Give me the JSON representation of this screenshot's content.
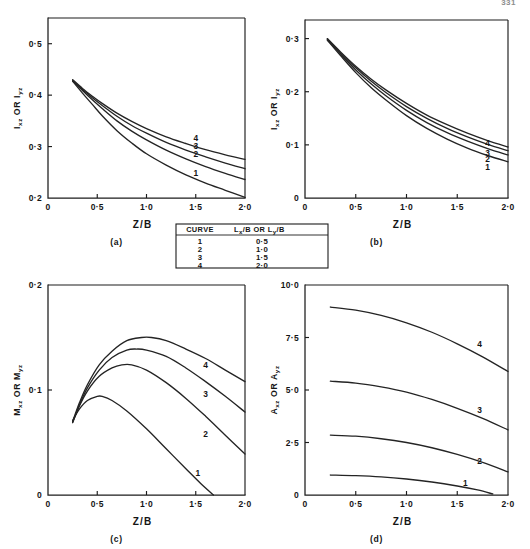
{
  "page": {
    "number": "331",
    "background_color": "#ffffff",
    "ink_color": "#1c1c1c"
  },
  "legend_table": {
    "name": "curve-legend",
    "headers": [
      "CURVE",
      "Lx/B  OR  Ly/B"
    ],
    "header_main": "CURVE",
    "header_value": "L",
    "header_value_sub1": "x",
    "header_value_mid": "/B  OR  L",
    "header_value_sub2": "y",
    "header_value_end": "/B",
    "rows": [
      {
        "curve": "1",
        "ratio": "0·5"
      },
      {
        "curve": "2",
        "ratio": "1·0"
      },
      {
        "curve": "3",
        "ratio": "1·5"
      },
      {
        "curve": "4",
        "ratio": "2·0"
      }
    ]
  },
  "chart_data": [
    {
      "id": "panel-a",
      "type": "line",
      "caption": "(a)",
      "title": "",
      "ylabel": "Ixz OR Iyz",
      "ylabel_parts": {
        "sym1": "I",
        "sub1": "xz",
        "mid": " OR ",
        "sym2": "I",
        "sub2": "yz"
      },
      "xlabel": "Z/B",
      "xlim": [
        0,
        2.0
      ],
      "ylim": [
        0.2,
        0.55
      ],
      "xticks": [
        0,
        0.5,
        1.0,
        1.5,
        2.0
      ],
      "xticklabels": [
        "0",
        "0·5",
        "1·0",
        "1·5",
        "2·0"
      ],
      "yticks": [
        0.2,
        0.3,
        0.4,
        0.5
      ],
      "yticklabels": [
        "0·2",
        "0·3",
        "0·4",
        "0·5"
      ],
      "grid": false,
      "legend_position": "inline-right",
      "series": [
        {
          "name": "1",
          "label_xy": [
            1.5,
            0.243
          ],
          "x": [
            0.25,
            0.35,
            0.45,
            0.55,
            0.7,
            0.85,
            1.0,
            1.2,
            1.4,
            1.6,
            1.8,
            2.0
          ],
          "values": [
            0.427,
            0.404,
            0.382,
            0.36,
            0.331,
            0.307,
            0.286,
            0.264,
            0.245,
            0.229,
            0.215,
            0.201
          ]
        },
        {
          "name": "2",
          "label_xy": [
            1.5,
            0.279
          ],
          "x": [
            0.25,
            0.35,
            0.45,
            0.55,
            0.7,
            0.85,
            1.0,
            1.2,
            1.4,
            1.6,
            1.8,
            2.0
          ],
          "values": [
            0.428,
            0.409,
            0.391,
            0.374,
            0.35,
            0.33,
            0.313,
            0.293,
            0.276,
            0.261,
            0.248,
            0.236
          ]
        },
        {
          "name": "3",
          "label_xy": [
            1.5,
            0.295
          ],
          "x": [
            0.25,
            0.35,
            0.45,
            0.55,
            0.7,
            0.85,
            1.0,
            1.2,
            1.4,
            1.6,
            1.8,
            2.0
          ],
          "values": [
            0.429,
            0.411,
            0.395,
            0.38,
            0.359,
            0.341,
            0.326,
            0.308,
            0.293,
            0.28,
            0.268,
            0.257
          ]
        },
        {
          "name": "4",
          "label_xy": [
            1.5,
            0.311
          ],
          "x": [
            0.25,
            0.35,
            0.45,
            0.55,
            0.7,
            0.85,
            1.0,
            1.2,
            1.4,
            1.6,
            1.8,
            2.0
          ],
          "values": [
            0.43,
            0.413,
            0.398,
            0.384,
            0.365,
            0.349,
            0.335,
            0.319,
            0.306,
            0.294,
            0.284,
            0.275
          ]
        }
      ]
    },
    {
      "id": "panel-b",
      "type": "line",
      "caption": "(b)",
      "title": "",
      "ylabel": "Ixz OR Iyz",
      "ylabel_parts": {
        "sym1": "I",
        "sub1": "xz",
        "mid": " OR ",
        "sym2": "I",
        "sub2": "yz"
      },
      "xlabel": "Z/B",
      "xlim": [
        0,
        2.0
      ],
      "ylim": [
        0,
        0.335
      ],
      "xticks": [
        0,
        0.5,
        1.0,
        1.5,
        2.0
      ],
      "xticklabels": [
        "0",
        "0·5",
        "1·0",
        "1·5",
        "2·0"
      ],
      "yticks": [
        0,
        0.1,
        0.2,
        0.3
      ],
      "yticklabels": [
        "0",
        "0·1",
        "0·2",
        "0·3"
      ],
      "grid": false,
      "legend_position": "inline-right",
      "series": [
        {
          "name": "1",
          "label_xy": [
            1.8,
            0.052
          ],
          "x": [
            0.22,
            0.35,
            0.5,
            0.65,
            0.8,
            1.0,
            1.2,
            1.4,
            1.6,
            1.8,
            2.0
          ],
          "values": [
            0.297,
            0.268,
            0.236,
            0.208,
            0.184,
            0.155,
            0.131,
            0.111,
            0.094,
            0.08,
            0.068
          ]
        },
        {
          "name": "2",
          "label_xy": [
            1.8,
            0.068
          ],
          "x": [
            0.22,
            0.35,
            0.5,
            0.65,
            0.8,
            1.0,
            1.2,
            1.4,
            1.6,
            1.8,
            2.0
          ],
          "values": [
            0.298,
            0.271,
            0.241,
            0.215,
            0.192,
            0.165,
            0.142,
            0.123,
            0.107,
            0.093,
            0.081
          ]
        },
        {
          "name": "3",
          "label_xy": [
            1.8,
            0.079
          ],
          "x": [
            0.22,
            0.35,
            0.5,
            0.65,
            0.8,
            1.0,
            1.2,
            1.4,
            1.6,
            1.8,
            2.0
          ],
          "values": [
            0.299,
            0.273,
            0.245,
            0.22,
            0.198,
            0.172,
            0.15,
            0.131,
            0.115,
            0.101,
            0.089
          ]
        },
        {
          "name": "4",
          "label_xy": [
            1.8,
            0.097
          ],
          "x": [
            0.22,
            0.35,
            0.5,
            0.65,
            0.8,
            1.0,
            1.2,
            1.4,
            1.6,
            1.8,
            2.0
          ],
          "values": [
            0.3,
            0.275,
            0.248,
            0.224,
            0.203,
            0.178,
            0.156,
            0.138,
            0.122,
            0.108,
            0.096
          ]
        }
      ]
    },
    {
      "id": "panel-c",
      "type": "line",
      "caption": "(c)",
      "title": "",
      "ylabel": "Mxz OR Myz",
      "ylabel_parts": {
        "sym1": "M",
        "sub1": "xz",
        "mid": " OR ",
        "sym2": "M",
        "sub2": "yz"
      },
      "xlabel": "Z/B",
      "xlim": [
        0,
        2.0
      ],
      "ylim": [
        0,
        0.2
      ],
      "xticks": [
        0,
        0.5,
        1.0,
        1.5,
        2.0
      ],
      "xticklabels": [
        "0",
        "0·5",
        "1·0",
        "1·5",
        "2·0"
      ],
      "yticks": [
        0,
        0.1,
        0.2
      ],
      "yticklabels": [
        "0",
        "0·1",
        "0·2"
      ],
      "grid": false,
      "legend_position": "inline-right",
      "series": [
        {
          "name": "1",
          "label_xy": [
            1.52,
            0.018
          ],
          "x": [
            0.25,
            0.32,
            0.4,
            0.5,
            0.55,
            0.65,
            0.8,
            1.0,
            1.2,
            1.4,
            1.55,
            1.68
          ],
          "values": [
            0.071,
            0.082,
            0.09,
            0.094,
            0.094,
            0.09,
            0.08,
            0.063,
            0.044,
            0.025,
            0.011,
            0.0
          ]
        },
        {
          "name": "2",
          "label_xy": [
            1.6,
            0.055
          ],
          "x": [
            0.25,
            0.32,
            0.4,
            0.52,
            0.65,
            0.75,
            0.85,
            1.0,
            1.2,
            1.4,
            1.6,
            1.8,
            2.0
          ],
          "values": [
            0.069,
            0.085,
            0.099,
            0.113,
            0.121,
            0.124,
            0.124,
            0.119,
            0.107,
            0.092,
            0.075,
            0.057,
            0.039
          ]
        },
        {
          "name": "3",
          "label_xy": [
            1.6,
            0.093
          ],
          "x": [
            0.25,
            0.32,
            0.4,
            0.52,
            0.65,
            0.8,
            0.9,
            1.0,
            1.2,
            1.4,
            1.6,
            1.8,
            2.0
          ],
          "values": [
            0.069,
            0.086,
            0.102,
            0.119,
            0.131,
            0.138,
            0.139,
            0.138,
            0.132,
            0.121,
            0.108,
            0.094,
            0.079
          ]
        },
        {
          "name": "4",
          "label_xy": [
            1.6,
            0.121
          ],
          "x": [
            0.25,
            0.32,
            0.4,
            0.52,
            0.65,
            0.8,
            0.95,
            1.05,
            1.2,
            1.4,
            1.6,
            1.8,
            2.0
          ],
          "values": [
            0.07,
            0.088,
            0.105,
            0.124,
            0.137,
            0.147,
            0.15,
            0.15,
            0.147,
            0.139,
            0.13,
            0.119,
            0.108
          ]
        }
      ]
    },
    {
      "id": "panel-d",
      "type": "line",
      "caption": "(d)",
      "title": "",
      "ylabel": "Axz OR Ayz",
      "ylabel_parts": {
        "sym1": "A",
        "sub1": "xz",
        "mid": " OR ",
        "sym2": "A",
        "sub2": "yz"
      },
      "xlabel": "Z/B",
      "xlim": [
        0,
        2.0
      ],
      "ylim": [
        0,
        10.0
      ],
      "xticks": [
        0,
        0.5,
        1.0,
        1.5,
        2.0
      ],
      "xticklabels": [
        "0",
        "0·5",
        "1·0",
        "1·5",
        "2·0"
      ],
      "yticks": [
        0,
        2.5,
        5.0,
        7.5,
        10.0
      ],
      "yticklabels": [
        "0",
        "2·5",
        "5·0",
        "7·5",
        "10·0"
      ],
      "grid": false,
      "legend_position": "inline-right",
      "series": [
        {
          "name": "1",
          "label_xy": [
            1.58,
            0.42
          ],
          "x": [
            0.25,
            0.5,
            0.75,
            1.0,
            1.25,
            1.5,
            1.7,
            1.85
          ],
          "values": [
            0.95,
            0.92,
            0.86,
            0.76,
            0.62,
            0.43,
            0.24,
            0.05
          ]
        },
        {
          "name": "2",
          "label_xy": [
            1.72,
            1.48
          ],
          "x": [
            0.25,
            0.5,
            0.75,
            1.0,
            1.25,
            1.5,
            1.75,
            2.0
          ],
          "values": [
            2.85,
            2.8,
            2.68,
            2.5,
            2.25,
            1.93,
            1.55,
            1.1
          ]
        },
        {
          "name": "3",
          "label_xy": [
            1.72,
            3.92
          ],
          "x": [
            0.25,
            0.5,
            0.75,
            1.0,
            1.25,
            1.5,
            1.75,
            2.0
          ],
          "values": [
            5.42,
            5.33,
            5.15,
            4.9,
            4.55,
            4.13,
            3.65,
            3.1
          ]
        },
        {
          "name": "4",
          "label_xy": [
            1.72,
            7.05
          ],
          "x": [
            0.25,
            0.5,
            0.75,
            1.0,
            1.25,
            1.5,
            1.75,
            2.0
          ],
          "values": [
            8.95,
            8.8,
            8.55,
            8.2,
            7.75,
            7.2,
            6.58,
            5.88
          ]
        }
      ]
    }
  ]
}
